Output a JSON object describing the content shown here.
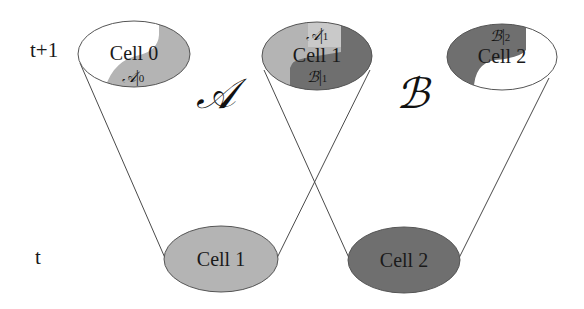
{
  "time_labels": {
    "upper": "t+1",
    "lower": "t"
  },
  "set_labels": {
    "A": "𝒜",
    "B": "ℬ"
  },
  "cells_t_plus_1": [
    {
      "id": "cell0",
      "label": "Cell 0",
      "sub_labels": [
        "𝒜|₀"
      ]
    },
    {
      "id": "cell1",
      "label": "Cell 1",
      "sub_labels": [
        "𝒜|₁",
        "ℬ|₁"
      ]
    },
    {
      "id": "cell2",
      "label": "Cell 2",
      "sub_labels": [
        "ℬ|₂"
      ]
    }
  ],
  "cells_t": [
    {
      "id": "cell1",
      "label": "Cell 1",
      "set": "A"
    },
    {
      "id": "cell2",
      "label": "Cell 2",
      "set": "B"
    }
  ],
  "colors": {
    "set_A_fill": "#b4b4b4",
    "set_A_light": "#c9c9c9",
    "set_B_fill": "#6f6f6f",
    "empty_fill": "#ffffff",
    "outline": "#555555",
    "line": "#4a4a4a"
  },
  "subs": {
    "a0": "0",
    "a1": "1",
    "b1": "1",
    "b2": "2"
  }
}
